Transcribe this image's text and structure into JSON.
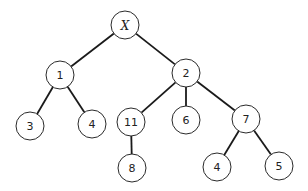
{
  "diagram": {
    "type": "tree",
    "root": "X",
    "nodes": [
      {
        "id": "nX",
        "label": "X",
        "italic": true,
        "x": 125,
        "y": 25
      },
      {
        "id": "n1",
        "label": "1",
        "x": 60,
        "y": 75
      },
      {
        "id": "n2",
        "label": "2",
        "x": 186,
        "y": 73
      },
      {
        "id": "n3",
        "label": "3",
        "x": 30,
        "y": 126
      },
      {
        "id": "n4a",
        "label": "4",
        "x": 92,
        "y": 124
      },
      {
        "id": "n11",
        "label": "11",
        "x": 131,
        "y": 122
      },
      {
        "id": "n6",
        "label": "6",
        "x": 186,
        "y": 120
      },
      {
        "id": "n7",
        "label": "7",
        "x": 246,
        "y": 119
      },
      {
        "id": "n8",
        "label": "8",
        "x": 132,
        "y": 168
      },
      {
        "id": "n4b",
        "label": "4",
        "x": 217,
        "y": 167
      },
      {
        "id": "n5",
        "label": "5",
        "x": 279,
        "y": 166
      }
    ],
    "edges": [
      {
        "from": "nX",
        "to": "n1"
      },
      {
        "from": "nX",
        "to": "n2"
      },
      {
        "from": "n1",
        "to": "n3"
      },
      {
        "from": "n1",
        "to": "n4a"
      },
      {
        "from": "n2",
        "to": "n11"
      },
      {
        "from": "n2",
        "to": "n6"
      },
      {
        "from": "n2",
        "to": "n7"
      },
      {
        "from": "n11",
        "to": "n8"
      },
      {
        "from": "n7",
        "to": "n4b"
      },
      {
        "from": "n7",
        "to": "n5"
      }
    ],
    "node_radius": 14,
    "colors": {
      "stroke": "#2a2a2a",
      "fill": "#ffffff",
      "text": "#222222"
    }
  }
}
